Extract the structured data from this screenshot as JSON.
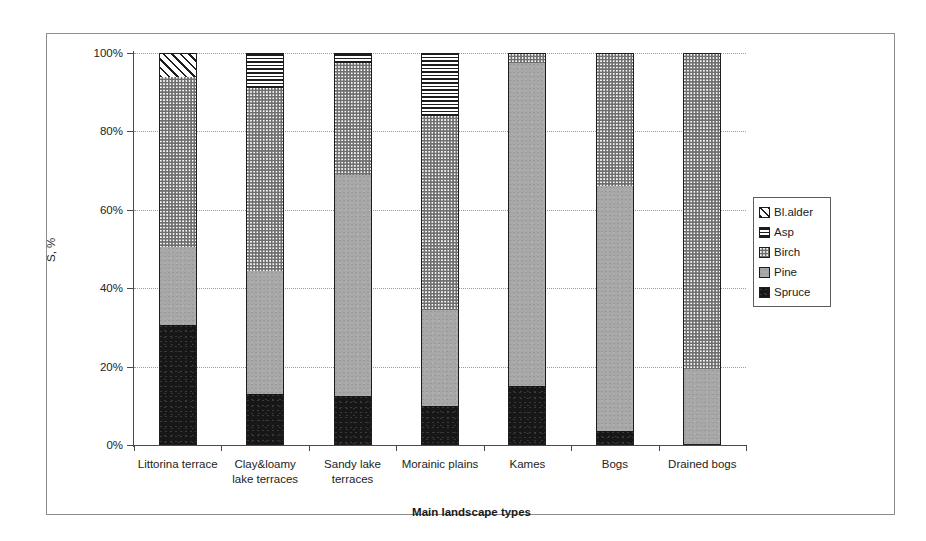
{
  "chart_data": {
    "type": "bar",
    "subtype": "stacked-100-percent",
    "title": "",
    "xlabel": "Main landscape types",
    "ylabel": "S, %",
    "ylim": [
      0,
      100
    ],
    "ytick_labels": [
      "0%",
      "20%",
      "40%",
      "60%",
      "80%",
      "100%"
    ],
    "ytick_values": [
      0,
      20,
      40,
      60,
      80,
      100
    ],
    "grid": "horizontal-dotted",
    "legend_position": "right-inside",
    "categories": [
      "Littorina terrace",
      "Clay&loamy lake terraces",
      "Sandy lake terraces",
      "Morainic plains",
      "Kames",
      "Bogs",
      "Drained bogs"
    ],
    "category_lines": [
      [
        "Littorina terrace"
      ],
      [
        "Clay&loamy",
        "lake terraces"
      ],
      [
        "Sandy lake",
        "terraces"
      ],
      [
        "Morainic plains"
      ],
      [
        "Kames"
      ],
      [
        "Bogs"
      ],
      [
        "Drained bogs"
      ]
    ],
    "series": [
      {
        "name": "Spruce",
        "pattern": "solid-black",
        "color": "#171717",
        "values": [
          30.5,
          13.0,
          12.5,
          10.0,
          15.0,
          3.5,
          0.0
        ]
      },
      {
        "name": "Pine",
        "pattern": "solid-gray",
        "color": "#a8a8a8",
        "values": [
          20.0,
          31.5,
          56.5,
          24.5,
          82.5,
          62.5,
          19.5
        ]
      },
      {
        "name": "Birch",
        "pattern": "dotted-speckle",
        "color": "#ffffff",
        "values": [
          43.5,
          46.5,
          28.5,
          49.5,
          2.5,
          34.0,
          80.5
        ]
      },
      {
        "name": "Asp",
        "pattern": "horizontal-lines",
        "color": "#ffffff",
        "values": [
          0.0,
          9.0,
          2.5,
          16.0,
          0.0,
          0.0,
          0.0
        ]
      },
      {
        "name": "Bl.alder",
        "pattern": "diagonal-hatch",
        "color": "#ffffff",
        "values": [
          6.0,
          0.0,
          0.0,
          0.0,
          0.0,
          0.0,
          0.0
        ]
      }
    ],
    "cumulative_tops": [
      [
        30.5,
        50.5,
        94.0,
        94.0,
        100.0
      ],
      [
        13.0,
        44.5,
        91.0,
        100.0,
        100.0
      ],
      [
        12.5,
        69.0,
        97.5,
        100.0,
        100.0
      ],
      [
        10.0,
        34.5,
        84.0,
        100.0,
        100.0
      ],
      [
        15.0,
        97.5,
        100.0,
        100.0,
        100.0
      ],
      [
        3.5,
        66.0,
        100.0,
        100.0,
        100.0
      ],
      [
        0.0,
        19.5,
        100.0,
        100.0,
        100.0
      ]
    ]
  },
  "legend": {
    "items": [
      {
        "label": "Bl.alder",
        "series": "Bl.alder"
      },
      {
        "label": "Asp",
        "series": "Asp"
      },
      {
        "label": "Birch",
        "series": "Birch"
      },
      {
        "label": "Pine",
        "series": "Pine"
      },
      {
        "label": "Spruce",
        "series": "Spruce"
      }
    ]
  },
  "axes": {
    "y_title": "S, %",
    "x_title": "Main landscape types"
  }
}
